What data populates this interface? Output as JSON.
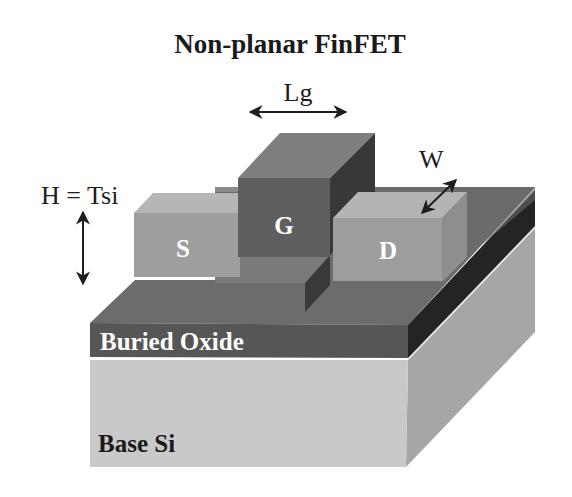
{
  "title": "Non-planar FinFET",
  "dimensions": {
    "gate_length": "Lg",
    "fin_width": "W",
    "fin_height": "H = Tsi"
  },
  "regions": {
    "source": "S",
    "gate": "G",
    "drain": "D",
    "buried_oxide": "Buried Oxide",
    "base_si": "Base Si"
  },
  "colors": {
    "base_front": "#c8c8c8",
    "base_side": "#a4a4a4",
    "box_top": "#6a6a6a",
    "box_front": "#555555",
    "box_side": "#262626",
    "sd_front": "#9c9c9c",
    "sd_top": "#b4b4b4",
    "sd_side": "#8e8e8e",
    "gate_front": "#5e5e5e",
    "gate_top": "#7c7c7c",
    "gate_side": "#3a3a3a",
    "fin_front": "#747474"
  }
}
